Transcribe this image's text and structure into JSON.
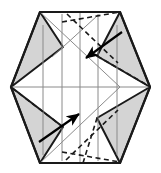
{
  "figure": {
    "type": "origami-step-diagram",
    "canvas": {
      "width": 161,
      "height": 173
    },
    "colors": {
      "paper_fill": "#ffffff",
      "flap_fill": "#d4d4d4",
      "outline_stroke": "#1a1a1a",
      "crease_solid_stroke": "#8a8a8a",
      "crease_dashed_stroke": "#1a1a1a",
      "arrow_stroke": "#000000",
      "background": "#ffffff"
    },
    "strokes": {
      "outline_width": 2.2,
      "flap_edge_width": 2.0,
      "crease_solid_width": 1.0,
      "crease_dashed_width": 1.6,
      "dash_pattern": "5,3.5",
      "arrow_width": 2.2
    }
  },
  "shapes": {
    "hexagon": {
      "name": "outer-hexagon",
      "points": "40,12 120,12 150,87 120,163 40,163 11,87"
    },
    "flaps": [
      {
        "name": "flap-top-left",
        "points": "40,12 63,47 11,87",
        "fill": "#d4d4d4"
      },
      {
        "name": "flap-top-right",
        "points": "120,12 150,87 97,56",
        "fill": "#d4d4d4"
      },
      {
        "name": "flap-bottom-left",
        "points": "11,87 63,127 40,163",
        "fill": "#d4d4d4"
      },
      {
        "name": "flap-bottom-right",
        "points": "150,87 120,163 97,118",
        "fill": "#d4d4d4"
      }
    ],
    "vertical_creases": [
      {
        "name": "crease-vertical-1",
        "x": 43,
        "y1": 25,
        "y2": 155
      },
      {
        "name": "crease-vertical-2",
        "x": 62,
        "y1": 14,
        "y2": 161
      },
      {
        "name": "crease-vertical-3",
        "x": 80,
        "y1": 12,
        "y2": 163
      },
      {
        "name": "crease-vertical-4",
        "x": 98,
        "y1": 14,
        "y2": 161
      },
      {
        "name": "crease-vertical-5",
        "x": 117,
        "y1": 25,
        "y2": 155
      }
    ],
    "horizontal_crease": {
      "name": "crease-horizontal-center",
      "x1": 11,
      "y1": 87,
      "x2": 150,
      "y2": 87
    },
    "diagonal_thin_creases": [
      {
        "name": "crease-thin-diagonal-upper",
        "x1": 40,
        "y1": 12,
        "x2": 120,
        "y2": 87
      },
      {
        "name": "crease-thin-diagonal-lower",
        "x1": 40,
        "y1": 163,
        "x2": 120,
        "y2": 87
      },
      {
        "name": "crease-thin-diagonal-top-left",
        "x1": 52,
        "y1": 57,
        "x2": 97,
        "y2": 16
      }
    ],
    "dashed_creases": [
      {
        "name": "dashed-crease-top",
        "x1": 62,
        "y1": 22,
        "x2": 120,
        "y2": 12
      },
      {
        "name": "dashed-crease-upper-right",
        "x1": 67,
        "y1": 14,
        "x2": 118,
        "y2": 63
      },
      {
        "name": "dashed-crease-right-fold",
        "x1": 97,
        "y1": 56,
        "x2": 149,
        "y2": 86
      },
      {
        "name": "dashed-crease-lower-left",
        "x1": 12,
        "y1": 88,
        "x2": 63,
        "y2": 127
      },
      {
        "name": "dashed-crease-lower-center",
        "x1": 66,
        "y1": 160,
        "x2": 118,
        "y2": 110
      },
      {
        "name": "dashed-crease-bottom",
        "x1": 62,
        "y1": 152,
        "x2": 120,
        "y2": 162
      },
      {
        "name": "dashed-crease-bottom-right",
        "x1": 83,
        "y1": 163,
        "x2": 97,
        "y2": 118
      }
    ],
    "arrows": [
      {
        "name": "arrow-fold-down-left",
        "direction": "down-left",
        "x1": 122,
        "y1": 32,
        "x2": 86,
        "y2": 58
      },
      {
        "name": "arrow-fold-up-right",
        "direction": "up-right",
        "x1": 39,
        "y1": 142,
        "x2": 79,
        "y2": 114
      }
    ]
  }
}
